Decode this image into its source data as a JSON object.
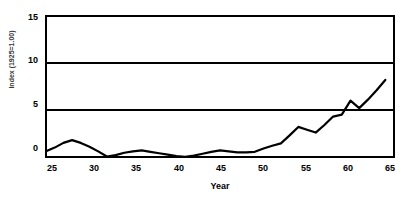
{
  "chart_data": {
    "type": "line",
    "title": "Economic Value of Commercial Land",
    "title_visible": false,
    "xlabel": "Year",
    "ylabel": "Index (1925=1.00)",
    "xlim": [
      25,
      65
    ],
    "ylim": [
      0,
      15
    ],
    "xticks": [
      25,
      30,
      35,
      40,
      45,
      50,
      55,
      60,
      65
    ],
    "yticks": [
      0,
      5,
      10,
      15
    ],
    "grid": "horizontal",
    "legend": "none",
    "line_color": "#000000",
    "line_width": 2.2,
    "series": [
      {
        "name": "Index (1925=1.00)",
        "x": [
          25,
          26,
          27,
          28,
          29,
          30,
          31,
          32,
          33,
          34,
          35,
          36,
          37,
          38,
          39,
          40,
          41,
          42,
          43,
          44,
          45,
          46,
          47,
          48,
          49,
          50,
          51,
          52,
          53,
          54,
          55,
          56,
          57,
          58,
          59,
          60,
          61,
          62,
          63,
          64
        ],
        "values": [
          0.6,
          1.0,
          1.5,
          1.8,
          1.5,
          1.1,
          0.6,
          0.05,
          0.2,
          0.45,
          0.6,
          0.7,
          0.55,
          0.4,
          0.25,
          0.1,
          0.02,
          0.15,
          0.35,
          0.55,
          0.7,
          0.6,
          0.5,
          0.5,
          0.55,
          0.9,
          1.2,
          1.45,
          2.3,
          3.2,
          2.9,
          2.6,
          3.4,
          4.3,
          4.5,
          6.0,
          5.2,
          6.1,
          7.1,
          8.2
        ]
      }
    ]
  },
  "axes": {
    "y_tick_labels": [
      "15",
      "10",
      "5",
      "0"
    ],
    "x_tick_labels": [
      "25",
      "30",
      "35",
      "40",
      "45",
      "50",
      "55",
      "60",
      "65"
    ]
  },
  "labels": {
    "x_axis_title": "Year",
    "y_axis_title": "Index (1925=1.00)"
  }
}
